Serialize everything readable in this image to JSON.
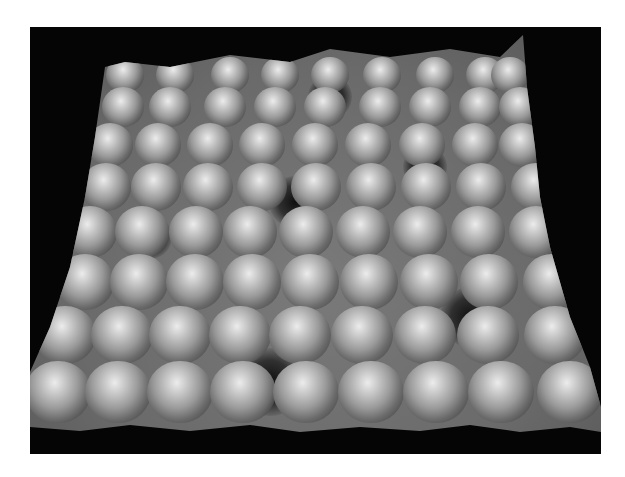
{
  "image": {
    "description": "3D-rendered grayscale scanning-probe topography of a hexagonal atomic lattice",
    "frame_color": "#050505",
    "surface_base": "#6e6e6e",
    "highlight": "#e8e8e8",
    "shadow": "#1a1a1a"
  },
  "rows": [
    {
      "y": 48,
      "size": 38,
      "xs": [
        95,
        145,
        200,
        250,
        300,
        352,
        405,
        455,
        480
      ]
    },
    {
      "y": 80,
      "size": 42,
      "xs": [
        88,
        135,
        190,
        240,
        290,
        345,
        395,
        445,
        485
      ]
    },
    {
      "y": 118,
      "size": 46,
      "xs": [
        80,
        128,
        180,
        232,
        285,
        338,
        392,
        445,
        492
      ]
    },
    {
      "y": 160,
      "size": 50,
      "xs": [
        70,
        120,
        172,
        226,
        280,
        335,
        390,
        445,
        500
      ]
    },
    {
      "y": 205,
      "size": 54,
      "xs": [
        60,
        112,
        166,
        220,
        276,
        333,
        390,
        448,
        506
      ]
    },
    {
      "y": 255,
      "size": 58,
      "xs": [
        48,
        102,
        158,
        215,
        273,
        332,
        392,
        452,
        515
      ]
    },
    {
      "y": 308,
      "size": 62,
      "xs": [
        35,
        92,
        150,
        210,
        270,
        332,
        395,
        458,
        525
      ]
    },
    {
      "y": 365,
      "size": 66,
      "xs": [
        20,
        80,
        142,
        205,
        268,
        333,
        398,
        463,
        532
      ]
    }
  ],
  "pits": [
    {
      "x": 300,
      "y": 70,
      "r": 22
    },
    {
      "x": 265,
      "y": 175,
      "r": 26
    },
    {
      "x": 440,
      "y": 290,
      "r": 30
    },
    {
      "x": 240,
      "y": 355,
      "r": 34
    },
    {
      "x": 120,
      "y": 210,
      "r": 22
    },
    {
      "x": 395,
      "y": 140,
      "r": 22
    }
  ]
}
